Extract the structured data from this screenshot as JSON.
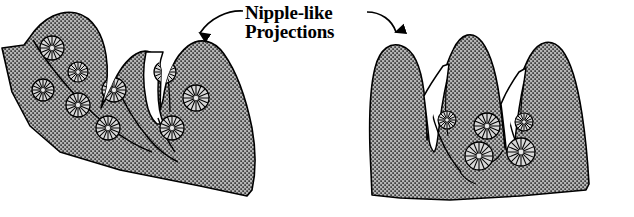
{
  "figure": {
    "background_color": "#ffffff",
    "width": 634,
    "height": 217,
    "annotation": {
      "name": "nipple-like-projections-label",
      "line1": "Nipple-like",
      "line2": "Projections",
      "text_color": "#000000",
      "font_weight": "bold",
      "font_style": "serif",
      "x": 245,
      "y_line1": 19,
      "y_line2": 38
    },
    "leader_lines": [
      {
        "name": "leader-arrow-left",
        "from_x": 243,
        "from_y": 12,
        "to_x": 196,
        "to_y": 48,
        "arrowhead": "down",
        "color": "#000000"
      },
      {
        "name": "leader-arrow-right",
        "from_x": 366,
        "from_y": 13,
        "to_x": 396,
        "to_y": 46,
        "arrowhead": "down",
        "color": "#000000"
      }
    ],
    "tissue_fill": {
      "base_color": "#b5b5b5",
      "stipple_color": "#151515",
      "outline_color": "#000000",
      "outline_width": 1.6
    },
    "cell_marker": {
      "name": "radial-cell",
      "fill_color": "#d8d8d8",
      "stroke_color": "#000000",
      "spoke_count": 16,
      "description": "circle with radial spokes representing a secretory cell"
    },
    "panels": [
      {
        "name": "panel-left",
        "label": "left-tissue-section",
        "lobe_count": 3,
        "cell_count": 9
      },
      {
        "name": "panel-right",
        "label": "right-tissue-section",
        "lobe_count": 3,
        "cell_count": 5
      }
    ]
  }
}
